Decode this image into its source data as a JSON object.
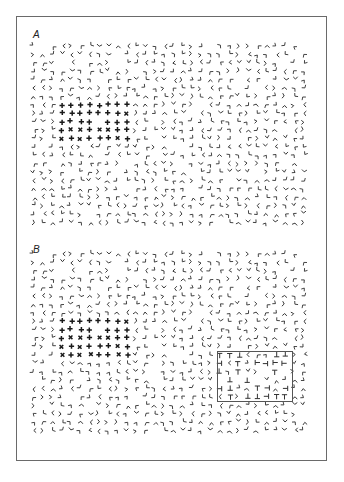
{
  "figure": {
    "panels": [
      {
        "id": "A",
        "label": "A",
        "label_pos": {
          "x": 33,
          "y": 29
        },
        "grid": {
          "x0": 34,
          "y0": 46,
          "cols": 30,
          "rows": 22,
          "dx": 9.3,
          "dy": 8.4
        },
        "background_element": "L-shape",
        "target_region": {
          "element": "cross",
          "row_start": 7,
          "row_end": 11,
          "col_start": 3,
          "col_end": 10
        },
        "box": null
      },
      {
        "id": "B",
        "label": "B",
        "label_pos": {
          "x": 33,
          "y": 244
        },
        "grid": {
          "x0": 34,
          "y0": 254,
          "cols": 30,
          "rows": 22,
          "dx": 9.3,
          "dy": 8.4
        },
        "background_element": "L-shape",
        "target_region": {
          "element": "cross",
          "row_start": 8,
          "row_end": 12,
          "col_start": 3,
          "col_end": 10
        },
        "box": {
          "x": 217,
          "y": 351,
          "w": 76,
          "h": 51,
          "element": "T-shape",
          "row_start": 12,
          "row_end": 17,
          "col_start": 20,
          "col_end": 27
        }
      }
    ],
    "colors": {
      "ink": "#333333",
      "cross_ink": "#1a1a1a",
      "frame": "#6a6a6a",
      "box": "#555555"
    }
  }
}
